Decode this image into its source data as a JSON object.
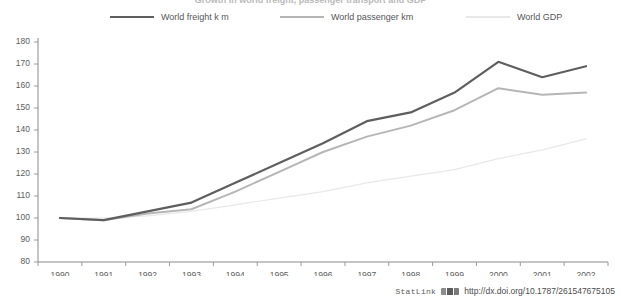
{
  "title": "Growth in world freight, passenger transport and GDP",
  "legend": {
    "items": [
      {
        "label": "World freight k m",
        "color": "#5e5e60"
      },
      {
        "label": "World passenger km",
        "color": "#b6b6b6"
      },
      {
        "label": "World GDP",
        "color": "#e8e8e8"
      }
    ]
  },
  "footer": {
    "statlink_label": "StatLink",
    "icon": "statlink-barcode-icon",
    "url": "http://dx.doi.org/10.1787/261547675105"
  },
  "chart_data": {
    "type": "line",
    "title": "Growth in world freight, passenger transport and GDP",
    "xlabel": "",
    "ylabel": "",
    "ylim": [
      80,
      180
    ],
    "ytick_step": 10,
    "grid": false,
    "legend_position": "top",
    "categories": [
      "1990",
      "1991",
      "1992",
      "1993",
      "1994",
      "1995",
      "1996",
      "1997",
      "1998",
      "1999",
      "2000",
      "2001",
      "2002"
    ],
    "yticks": [
      "80",
      "90",
      "100",
      "110",
      "120",
      "130",
      "140",
      "150",
      "160",
      "170",
      "180"
    ],
    "series": [
      {
        "name": "World freight k m",
        "color": "#5e5e60",
        "values": [
          100,
          99,
          103,
          107,
          116,
          125,
          134,
          144,
          148,
          157,
          171,
          164,
          169
        ]
      },
      {
        "name": "World passenger km",
        "color": "#b6b6b6",
        "values": [
          100,
          99,
          102,
          104,
          112,
          121,
          130,
          137,
          142,
          149,
          159,
          156,
          157
        ]
      },
      {
        "name": "World GDP",
        "color": "#e8e8e8",
        "values": [
          100,
          100,
          101,
          103,
          106,
          109,
          112,
          116,
          119,
          122,
          127,
          131,
          136
        ]
      }
    ]
  }
}
